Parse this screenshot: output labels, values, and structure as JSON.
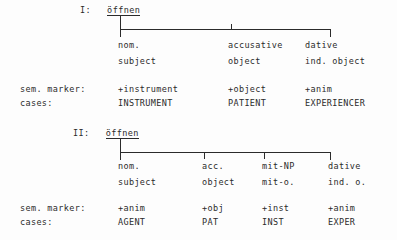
{
  "document": {
    "language": "de",
    "background_color": "#fdfdfd",
    "ink_color": "#2b2b2b"
  },
  "diagrams": [
    {
      "id": "frame-1",
      "numeral": "I:",
      "verb": "öffnen",
      "row_labels": {
        "sem_marker": "sem. marker:",
        "cases": "cases:"
      },
      "branches": [
        {
          "case_label": "nom.",
          "function_label": "subject",
          "sem_marker": "+instrument",
          "case_role": "INSTRUMENT"
        },
        {
          "case_label": "accusative",
          "function_label": "object",
          "sem_marker": "+object",
          "case_role": "PATIENT"
        },
        {
          "case_label": "dative",
          "function_label": "ind. object",
          "sem_marker": "+anim",
          "case_role": "EXPERIENCER"
        }
      ]
    },
    {
      "id": "frame-2",
      "numeral": "II:",
      "verb": "öffnen",
      "row_labels": {
        "sem_marker": "sem. marker:",
        "cases": "cases:"
      },
      "branches": [
        {
          "case_label": "nom.",
          "function_label": "subject",
          "sem_marker": "+anim",
          "case_role": "AGENT"
        },
        {
          "case_label": "acc.",
          "function_label": "object",
          "sem_marker": "+obj",
          "case_role": "PAT"
        },
        {
          "case_label": "mit-NP",
          "function_label": "mit-o.",
          "sem_marker": "+inst",
          "case_role": "INST"
        },
        {
          "case_label": "dative",
          "function_label": "ind. o.",
          "sem_marker": "+anim",
          "case_role": "EXPER"
        }
      ]
    }
  ]
}
